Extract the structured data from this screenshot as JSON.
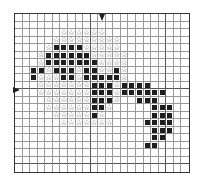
{
  "pattern": {
    "cols": 23,
    "rows": 21,
    "cell_px": 7.65,
    "origin": [
      14,
      13
    ],
    "legend": {
      "x": "filled-dark-square",
      "o": "outline-star",
      ".": "empty"
    },
    "colors": {
      "dark": "#1e1e1e",
      "star": "#444444",
      "grid": "#9a9a9a",
      "grid_major": "#555555",
      "border": "#333333"
    },
    "center_markers": {
      "top_arrow_col_line": 11.5,
      "left_arrow_row_line": 10.2
    },
    "grid": [
      ".......................",
      ".......................",
      "......oooooo...........",
      ".....ooooooooo.........",
      "....oxxxxooooo.........",
      "...oxxxxxxooooo........",
      "...oxxxxxxxoooo........",
      "..xxoxxxoxxooxo........",
      "..xoooxxoxxxxxo........",
      "...oooooooxxxoxxxx.....",
      "...oooooooxxxoxxxxxx...",
      "....ooooooxxxo..xxx....",
      "....ooooooxxo.....xxx..",
      ".....oooooxo......xxx..",
      "......ooooooo....xxxx..",
      "..................xxx..",
      "..................xx...",
      ".................xx....",
      ".......................",
      ".......................",
      "......................."
    ]
  }
}
